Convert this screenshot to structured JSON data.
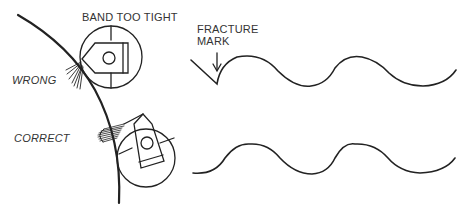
{
  "diagram": {
    "labels": {
      "band_too_tight": "BAND TOO TIGHT",
      "wrong": "WRONG",
      "correct": "CORRECT",
      "fracture_mark_line1": "FRACTURE",
      "fracture_mark_line2": "MARK"
    },
    "colors": {
      "line": "#222222",
      "text": "#333333",
      "background": "#ffffff"
    },
    "panels": [
      {
        "id": "wrong",
        "description": "band clamp too tight, wire fans out, fracture at wave start"
      },
      {
        "id": "correct",
        "description": "band clamp correctly seated, smooth wave"
      }
    ]
  }
}
